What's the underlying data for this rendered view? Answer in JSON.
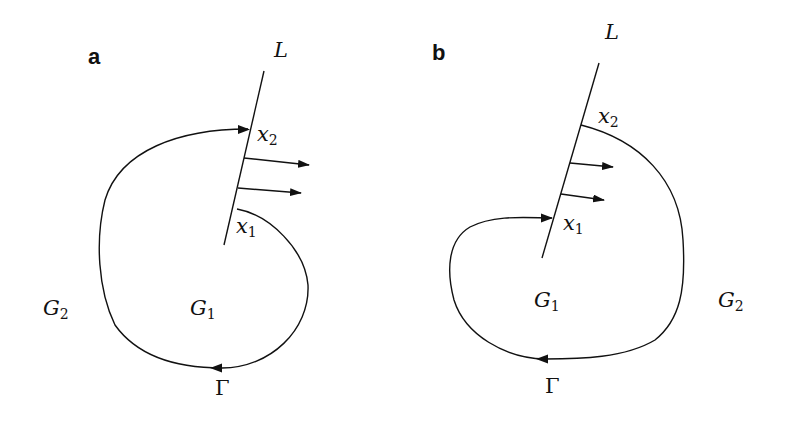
{
  "figure": {
    "panels": [
      {
        "id": "a",
        "letter": "a",
        "line_label": "L",
        "point_upper": {
          "base": "x",
          "sub": "2"
        },
        "point_lower": {
          "base": "x",
          "sub": "1"
        },
        "region_inner": {
          "base": "G",
          "sub": "1"
        },
        "region_outer": {
          "base": "G",
          "sub": "2"
        },
        "contour_label": "Γ"
      },
      {
        "id": "b",
        "letter": "b",
        "line_label": "L",
        "point_upper": {
          "base": "x",
          "sub": "2"
        },
        "point_lower": {
          "base": "x",
          "sub": "1"
        },
        "region_inner": {
          "base": "G",
          "sub": "1"
        },
        "region_outer": {
          "base": "G",
          "sub": "2"
        },
        "contour_label": "Γ"
      }
    ],
    "colors": {
      "stroke": "#111111",
      "background": "#ffffff"
    }
  }
}
